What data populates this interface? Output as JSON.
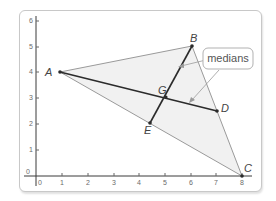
{
  "axes": {
    "x_ticks": [
      "0",
      "1",
      "2",
      "3",
      "4",
      "5",
      "6",
      "7",
      "8"
    ],
    "y_ticks": [
      "0",
      "1",
      "2",
      "3",
      "4",
      "5",
      "6"
    ]
  },
  "points": {
    "A": {
      "label": "A",
      "x": 1,
      "y": 4
    },
    "B": {
      "label": "B",
      "x": 6,
      "y": 5
    },
    "C": {
      "label": "C",
      "x": 8,
      "y": 0
    },
    "D": {
      "label": "D",
      "x": 7,
      "y": 2.5
    },
    "E": {
      "label": "E",
      "x": 4.5,
      "y": 2
    },
    "G": {
      "label": "G",
      "x": 5,
      "y": 3
    }
  },
  "callout": {
    "text": "medians"
  },
  "colors": {
    "triangle_fill": "#f1f1f1",
    "triangle_edge": "#8a8a8a",
    "median": "#2b2b2b",
    "axis": "#3a3a3a"
  }
}
